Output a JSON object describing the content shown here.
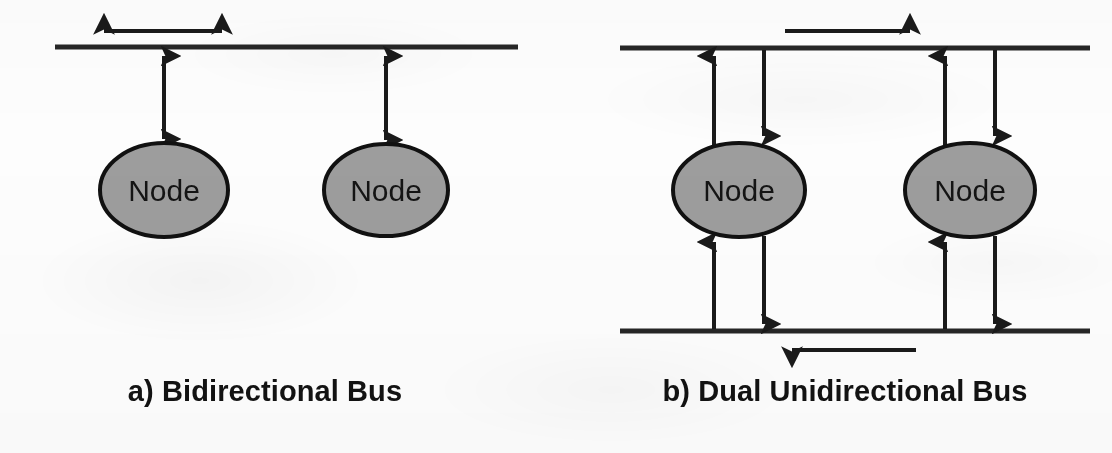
{
  "figure": {
    "background_color": "#fdfdfd",
    "ink_color": "#1a1a1a",
    "node_fill_color": "#9d9d9d",
    "node_stroke_color": "#111111",
    "width": 1112,
    "height": 453
  },
  "panels": [
    {
      "id": "a",
      "caption": "a) Bidirectional Bus",
      "bus_count": 1,
      "buses": [
        {
          "name": "shared-bus",
          "orientation": "horizontal",
          "y": 47,
          "x_start": 55,
          "x_end": 518,
          "thickness": 5,
          "direction_label": "bidirectional",
          "flow_arrow": {
            "name": "bus-direction-arrow",
            "type": "double-headed",
            "x_start": 98,
            "x_end": 228,
            "y": 31
          }
        }
      ],
      "nodes": [
        {
          "label": "Node",
          "cx": 164,
          "cy": 190,
          "rx": 64,
          "ry": 47
        },
        {
          "label": "Node",
          "cx": 386,
          "cy": 190,
          "rx": 62,
          "ry": 46
        }
      ],
      "links": [
        {
          "name": "node-bus-link",
          "type": "double-headed",
          "x": 164,
          "y_top": 49,
          "y_bottom": 145
        },
        {
          "name": "node-bus-link",
          "type": "double-headed",
          "x": 386,
          "y_top": 49,
          "y_bottom": 146
        }
      ]
    },
    {
      "id": "b",
      "caption": "b) Dual Unidirectional Bus",
      "bus_count": 2,
      "buses": [
        {
          "name": "upper-bus",
          "orientation": "horizontal",
          "y": 48,
          "x_start": 620,
          "x_end": 1090,
          "thickness": 5,
          "direction_label": "rightward",
          "flow_arrow": {
            "name": "bus-direction-arrow",
            "type": "single-headed-right",
            "x_start": 785,
            "x_end": 916,
            "y": 31
          }
        },
        {
          "name": "lower-bus",
          "orientation": "horizontal",
          "y": 331,
          "x_start": 620,
          "x_end": 1090,
          "thickness": 5,
          "direction_label": "leftward",
          "flow_arrow": {
            "name": "bus-direction-arrow",
            "type": "single-headed-left",
            "x_start": 916,
            "x_end": 786,
            "y": 350
          }
        }
      ],
      "nodes": [
        {
          "label": "Node",
          "cx": 739,
          "cy": 190,
          "rx": 66,
          "ry": 47
        },
        {
          "label": "Node",
          "cx": 970,
          "cy": 190,
          "rx": 65,
          "ry": 47
        }
      ],
      "links": [
        {
          "name": "node-to-upper-bus-out",
          "type": "single-headed-up",
          "x": 714,
          "y_from": 146,
          "y_to": 50
        },
        {
          "name": "upper-bus-to-node-in",
          "type": "single-headed-down",
          "x": 764,
          "y_from": 50,
          "y_to": 142
        },
        {
          "name": "lower-bus-to-node-in",
          "type": "single-headed-up",
          "x": 714,
          "y_from": 329,
          "y_to": 236
        },
        {
          "name": "node-to-lower-bus-out",
          "type": "single-headed-down",
          "x": 764,
          "y_from": 236,
          "y_to": 329
        },
        {
          "name": "node-to-upper-bus-out",
          "type": "single-headed-up",
          "x": 945,
          "y_from": 146,
          "y_to": 50
        },
        {
          "name": "upper-bus-to-node-in",
          "type": "single-headed-down",
          "x": 995,
          "y_from": 50,
          "y_to": 142
        },
        {
          "name": "lower-bus-to-node-in",
          "type": "single-headed-up",
          "x": 945,
          "y_from": 329,
          "y_to": 236
        },
        {
          "name": "node-to-lower-bus-out",
          "type": "single-headed-down",
          "x": 995,
          "y_from": 236,
          "y_to": 329
        }
      ]
    }
  ]
}
